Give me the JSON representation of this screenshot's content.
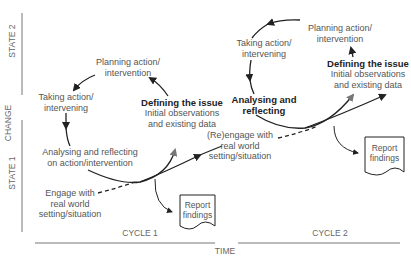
{
  "axes": {
    "vertical_label": "CHANGE",
    "horizontal_label": "TIME",
    "state1": "STATE 1",
    "state2": "STATE 2",
    "cycle1": "CYCLE 1",
    "cycle2": "CYCLE 2"
  },
  "cycle1": {
    "planning": [
      "Planning action/",
      "intervention"
    ],
    "taking": [
      "Taking action/",
      "intervening"
    ],
    "analysing": [
      "Analysing and reflecting",
      "on action/intervention"
    ],
    "defining_title": "Defining the issue",
    "defining_sub": [
      "Initial observations",
      "and existing data"
    ],
    "engage": [
      "Engage with",
      "real world",
      "setting/situation"
    ],
    "report": [
      "Report",
      "findings"
    ]
  },
  "cycle2": {
    "planning": [
      "Planning action/",
      "intervention"
    ],
    "taking": [
      "Taking action/",
      "intervening"
    ],
    "analysing": [
      "Analysing and",
      "reflecting"
    ],
    "defining_title": "Defining the issue",
    "defining_sub": [
      "Initial observations",
      "and existing data"
    ],
    "reengage": [
      "(Re)engage with",
      "real  world",
      "setting/situation"
    ],
    "report": [
      "Report",
      "findings"
    ]
  },
  "colors": {
    "line": "#222222",
    "gray_arrow": "#777777",
    "axis": "#666666",
    "text": "#555555"
  }
}
